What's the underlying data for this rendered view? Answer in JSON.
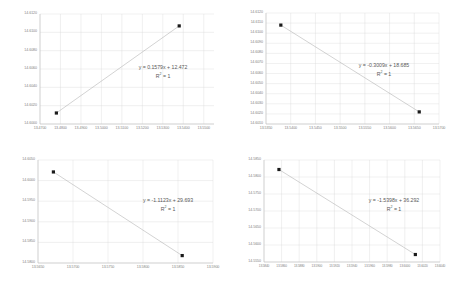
{
  "figure": {
    "panel_count": 4,
    "layout": "2x2",
    "background_color": "#ffffff",
    "gridline_color": "#d9d9d9",
    "axis_color": "#bfbfbf",
    "marker_color": "#1a1a1a",
    "trendline_color": "#a6a6a6",
    "text_color": "#595959"
  },
  "chart_data": [
    {
      "id": "panel-top-left",
      "type": "scatter",
      "title": "",
      "xlabel": "",
      "ylabel": "",
      "xlim": [
        13.47,
        13.555
      ],
      "ylim": [
        14.6,
        14.612
      ],
      "grid": true,
      "legend": "none",
      "xticks": [
        "13.4700",
        "13.4800",
        "13.4900",
        "13.5000",
        "13.5100",
        "13.5200",
        "13.5300",
        "13.5400",
        "13.5500"
      ],
      "xtick_values": [
        13.47,
        13.48,
        13.49,
        13.5,
        13.51,
        13.52,
        13.53,
        13.54,
        13.55
      ],
      "yticks": [
        "14.6120",
        "14.6100",
        "14.6080",
        "14.6060",
        "14.6040",
        "14.6020",
        "14.6000"
      ],
      "ytick_values": [
        14.612,
        14.61,
        14.608,
        14.606,
        14.604,
        14.602,
        14.6
      ],
      "points": [
        {
          "x": 13.478,
          "y": 14.6012
        },
        {
          "x": 13.538,
          "y": 14.6107
        }
      ],
      "trendline": {
        "slope": 0.1579,
        "intercept": 12.472,
        "equation": "y = 0.1579x + 12.472",
        "r2_label": "R² = 1",
        "r2_value": 1
      },
      "annotation": {
        "line1": "y = 0.1579x + 12.472",
        "line2": "R² = 1"
      }
    },
    {
      "id": "panel-top-right",
      "type": "scatter",
      "title": "",
      "xlabel": "",
      "ylabel": "",
      "xlim": [
        13.535,
        13.57
      ],
      "ylim": [
        14.601,
        14.612
      ],
      "grid": true,
      "legend": "none",
      "xticks": [
        "13.5350",
        "13.5400",
        "13.5450",
        "13.5500",
        "13.5550",
        "13.5600",
        "13.5650",
        "13.5700"
      ],
      "xtick_values": [
        13.535,
        13.54,
        13.545,
        13.55,
        13.555,
        13.56,
        13.565,
        13.57
      ],
      "yticks": [
        "14.6120",
        "14.6110",
        "14.6100",
        "14.6090",
        "14.6080",
        "14.6070",
        "14.6060",
        "14.6050",
        "14.6040",
        "14.6030",
        "14.6020",
        "14.6010"
      ],
      "ytick_values": [
        14.612,
        14.611,
        14.61,
        14.609,
        14.608,
        14.607,
        14.606,
        14.605,
        14.604,
        14.603,
        14.602,
        14.601
      ],
      "points": [
        {
          "x": 13.538,
          "y": 14.6108
        },
        {
          "x": 13.566,
          "y": 14.6022
        }
      ],
      "trendline": {
        "slope": -0.3009,
        "intercept": 18.685,
        "equation": "y = -0.3009x + 18.685",
        "r2_label": "R² = 1",
        "r2_value": 1
      },
      "annotation": {
        "line1": "y = -0.3009x + 18.685",
        "line2": "R² = 1"
      }
    },
    {
      "id": "panel-bottom-left",
      "type": "scatter",
      "title": "",
      "xlabel": "",
      "ylabel": "",
      "xlim": [
        13.565,
        13.59
      ],
      "ylim": [
        14.58,
        14.605
      ],
      "grid": true,
      "legend": "none",
      "xticks": [
        "13.5650",
        "13.5700",
        "13.5750",
        "13.5800",
        "13.5850",
        "13.5900"
      ],
      "xtick_values": [
        13.565,
        13.57,
        13.575,
        13.58,
        13.585,
        13.59
      ],
      "yticks": [
        "14.6050",
        "14.6000",
        "14.5950",
        "14.5900",
        "14.5850",
        "14.5800"
      ],
      "ytick_values": [
        14.605,
        14.6,
        14.595,
        14.59,
        14.585,
        14.58
      ],
      "points": [
        {
          "x": 13.5672,
          "y": 14.6021
        },
        {
          "x": 13.5856,
          "y": 14.5818
        }
      ],
      "trendline": {
        "slope": -1.1123,
        "intercept": 29.693,
        "equation": "y = -1.1123x + 29.693",
        "r2_label": "R² = 1",
        "r2_value": 1
      },
      "annotation": {
        "line1": "y = -1.1123x + 29.693",
        "line2": "R² = 1"
      }
    },
    {
      "id": "panel-bottom-right",
      "type": "scatter",
      "title": "",
      "xlabel": "",
      "ylabel": "",
      "xlim": [
        13.584,
        13.604
      ],
      "ylim": [
        14.555,
        14.585
      ],
      "grid": true,
      "legend": "none",
      "xticks": [
        "13.5840",
        "13.5860",
        "13.5880",
        "13.5900",
        "13.5920",
        "13.5940",
        "13.5960",
        "13.5980",
        "13.6000",
        "13.6020",
        "13.6040"
      ],
      "xtick_values": [
        13.584,
        13.586,
        13.588,
        13.59,
        13.592,
        13.594,
        13.596,
        13.598,
        13.6,
        13.602,
        13.604
      ],
      "yticks": [
        "14.5850",
        "14.5800",
        "14.5750",
        "14.5700",
        "14.5650",
        "14.5600",
        "14.5550"
      ],
      "ytick_values": [
        14.585,
        14.58,
        14.575,
        14.57,
        14.565,
        14.56,
        14.555
      ],
      "points": [
        {
          "x": 13.5857,
          "y": 14.5822
        },
        {
          "x": 13.6012,
          "y": 14.5572
        }
      ],
      "trendline": {
        "slope": -1.5398,
        "intercept": 36.292,
        "equation": "y = -1.5398x + 36.292",
        "r2_label": "R² = 1",
        "r2_value": 1
      },
      "annotation": {
        "line1": "y = -1.5398x + 36.292",
        "line2": "R² = 1"
      }
    }
  ]
}
